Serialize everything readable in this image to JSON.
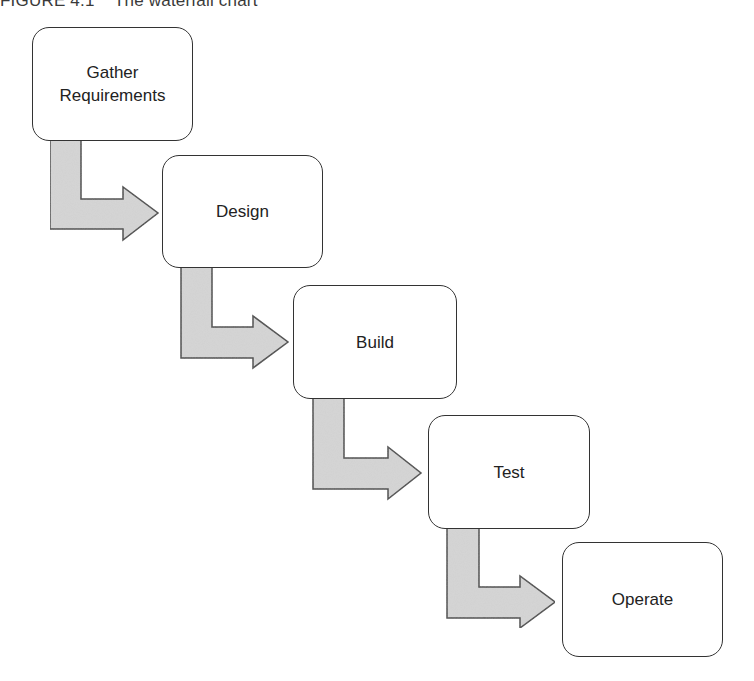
{
  "caption": "FIGURE 4.1    The waterfall chart",
  "diagram": {
    "type": "waterfall-flow",
    "colors": {
      "box_border": "#333333",
      "box_fill": "#ffffff",
      "arrow_fill": "#d6d6d6",
      "arrow_stroke": "#444444"
    },
    "steps": [
      {
        "label": "Gather Requirements"
      },
      {
        "label": "Design"
      },
      {
        "label": "Build"
      },
      {
        "label": "Test"
      },
      {
        "label": "Operate"
      }
    ]
  }
}
